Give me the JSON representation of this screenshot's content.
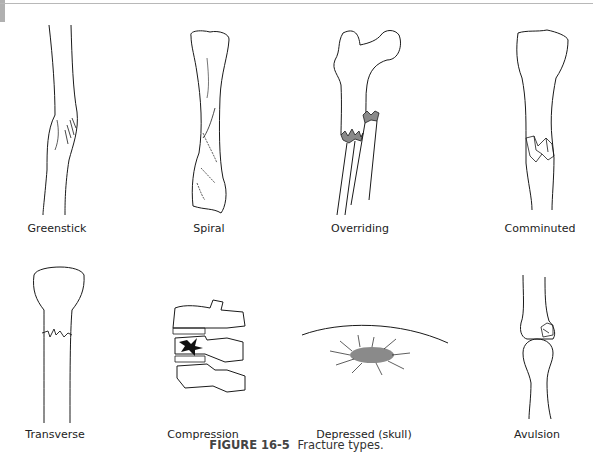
{
  "figure": {
    "number_label": "FIGURE 16-5",
    "caption_text": "Fracture types."
  },
  "panels": [
    {
      "id": "greenstick",
      "label": "Greenstick"
    },
    {
      "id": "spiral",
      "label": "Spiral"
    },
    {
      "id": "overriding",
      "label": "Overriding"
    },
    {
      "id": "comminuted",
      "label": "Comminuted"
    },
    {
      "id": "transverse",
      "label": "Transverse"
    },
    {
      "id": "compression",
      "label": "Compression"
    },
    {
      "id": "depressed",
      "label": "Depressed (skull)"
    },
    {
      "id": "avulsion",
      "label": "Avulsion"
    }
  ],
  "colors": {
    "line": "#1a1a1a",
    "fracture_fill": "#8a8a8a",
    "compression_mark": "#111111",
    "rule": "#b8b8b8"
  }
}
